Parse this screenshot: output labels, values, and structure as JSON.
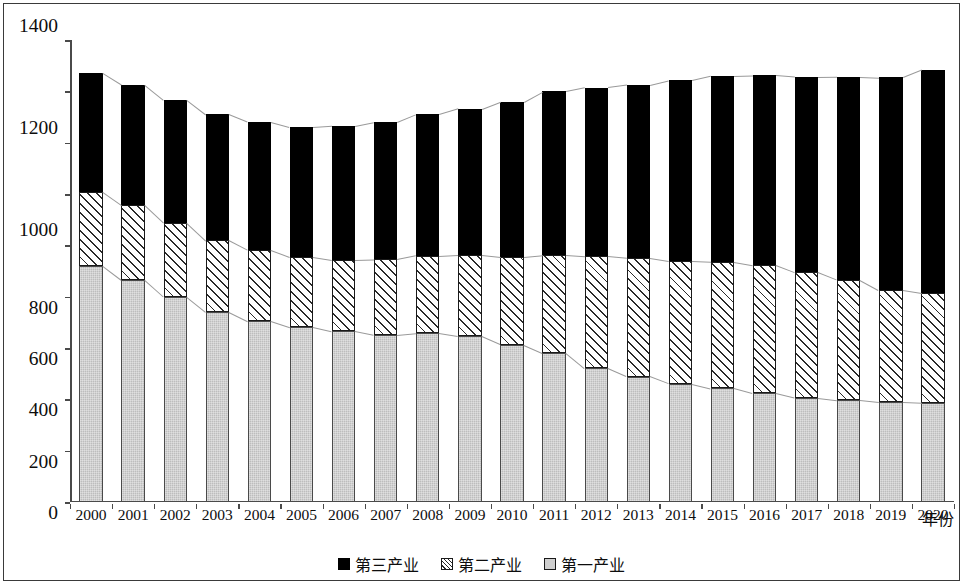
{
  "chart_data": {
    "type": "bar",
    "stacked": true,
    "title": "",
    "xlabel": "年份",
    "ylabel": "",
    "ylim": [
      0,
      1800
    ],
    "ytick_step": 200,
    "yticks": [
      0,
      200,
      400,
      600,
      800,
      1000,
      1200,
      1400,
      1600,
      1800
    ],
    "grid": false,
    "legend_position": "bottom-center",
    "categories": [
      "2000",
      "2001",
      "2002",
      "2003",
      "2004",
      "2005",
      "2006",
      "2007",
      "2008",
      "2009",
      "2010",
      "2011",
      "2012",
      "2013",
      "2014",
      "2015",
      "2016",
      "2017",
      "2018",
      "2019",
      "2020"
    ],
    "series": [
      {
        "name": "第一产业",
        "key": "s1",
        "color": "#bdbdbd",
        "pattern": "light-gray-fill",
        "values": [
          920,
          865,
          800,
          742,
          706,
          682,
          665,
          650,
          657,
          645,
          613,
          581,
          521,
          489,
          461,
          443,
          423,
          405,
          396,
          388,
          385
        ]
      },
      {
        "name": "第二产业",
        "key": "s2",
        "color": "#ffffff",
        "pattern": "diagonal-hatch",
        "values": [
          288,
          292,
          288,
          278,
          276,
          273,
          278,
          295,
          303,
          319,
          343,
          382,
          437,
          462,
          478,
          493,
          500,
          490,
          470,
          438,
          429
        ]
      },
      {
        "name": "第三产业",
        "key": "s3",
        "color": "#000000",
        "pattern": "solid-black",
        "values": [
          462,
          468,
          478,
          490,
          498,
          505,
          522,
          535,
          550,
          568,
          604,
          637,
          657,
          674,
          704,
          724,
          739,
          761,
          791,
          828,
          869
        ]
      }
    ],
    "totals": [
      1670,
      1625,
      1566,
      1510,
      1480,
      1460,
      1465,
      1480,
      1510,
      1532,
      1560,
      1600,
      1615,
      1625,
      1643,
      1660,
      1662,
      1656,
      1657,
      1654,
      1683
    ]
  },
  "legend": {
    "items": [
      {
        "label": "第三产业",
        "swatch": "solid-black-square-icon"
      },
      {
        "label": "第二产业",
        "swatch": "hatched-square-icon"
      },
      {
        "label": "第一产业",
        "swatch": "gray-square-icon"
      }
    ]
  },
  "axes": {
    "x_title": "年份",
    "y_title": ""
  }
}
